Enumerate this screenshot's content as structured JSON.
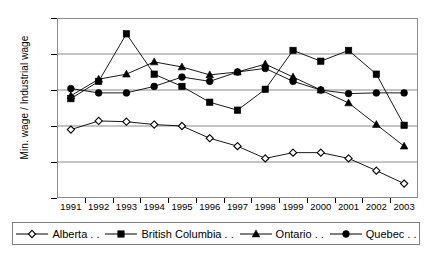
{
  "chart_data": {
    "type": "line",
    "title": "",
    "xlabel": "",
    "ylabel": "Min. wage / Industrial wage",
    "categories": [
      "1991",
      "1992",
      "1993",
      "1994",
      "1995",
      "1996",
      "1997",
      "1998",
      "1999",
      "2000",
      "2001",
      "2002",
      "2003"
    ],
    "ylim": [
      0.25,
      0.5
    ],
    "yticks": [
      "0.25",
      "0.30",
      "0.35",
      "0.40",
      "0.45",
      "0.50"
    ],
    "ytick_values": [
      0.25,
      0.3,
      0.35,
      0.4,
      0.45,
      0.5
    ],
    "grid": true,
    "legend_position": "bottom",
    "series": [
      {
        "name": "Alberta . .",
        "marker": "open-diamond",
        "values": [
          0.345,
          0.357,
          0.356,
          0.352,
          0.35,
          0.333,
          0.322,
          0.305,
          0.313,
          0.313,
          0.305,
          0.288,
          0.27
        ]
      },
      {
        "name": "British Columbia . .",
        "marker": "filled-square",
        "values": [
          0.388,
          0.412,
          0.478,
          0.422,
          0.405,
          0.383,
          0.372,
          0.401,
          0.455,
          0.44,
          0.455,
          0.422,
          0.351
        ]
      },
      {
        "name": "Ontario . .",
        "marker": "filled-triangle",
        "values": [
          0.392,
          0.415,
          0.422,
          0.439,
          0.432,
          0.421,
          0.425,
          0.436,
          0.418,
          0.4,
          0.382,
          0.352,
          0.322
        ]
      },
      {
        "name": "Quebec . .",
        "marker": "filled-circle",
        "values": [
          0.402,
          0.396,
          0.396,
          0.405,
          0.418,
          0.412,
          0.425,
          0.43,
          0.412,
          0.4,
          0.395,
          0.396,
          0.396
        ]
      }
    ]
  }
}
